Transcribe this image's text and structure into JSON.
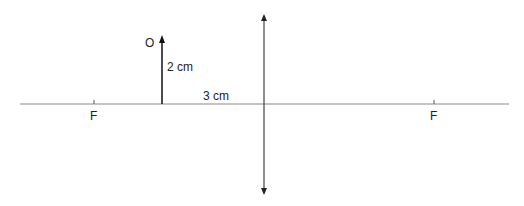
{
  "diagram": {
    "type": "converging-lens-ray-diagram",
    "object_label": "O",
    "object_height_label": "2 cm",
    "object_distance_label": "3 cm",
    "focal_point_left_label": "F",
    "focal_point_right_label": "F",
    "colors": {
      "axis": "#808080",
      "object": "#111111",
      "lens": "#444444",
      "text": "#222222"
    }
  }
}
